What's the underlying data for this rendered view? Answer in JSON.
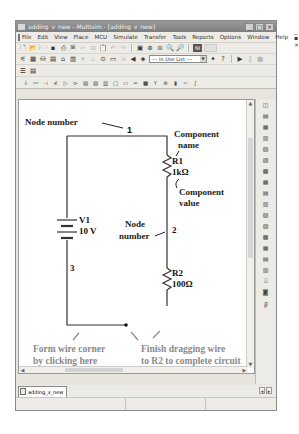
{
  "window": {
    "title": "adding_v_new - Multisim - [adding_v_new]",
    "controls": [
      "minimize",
      "maximize",
      "close"
    ]
  },
  "menubar": {
    "items": [
      "File",
      "Edit",
      "View",
      "Place",
      "MCU",
      "Simulate",
      "Transfer",
      "Tools",
      "Reports",
      "Options",
      "Window",
      "Help"
    ],
    "mdi_controls": "_ ▪ ×"
  },
  "toolbar": {
    "in_use_list": "--- In Use List ---"
  },
  "circuit": {
    "node1": "1",
    "node2": "2",
    "node3": "3",
    "source_name": "V1",
    "source_value": "10 V",
    "r1_name": "R1",
    "r1_value": "1kΩ",
    "r2_name": "R2",
    "r2_value": "100Ω"
  },
  "annotations": {
    "node_number_top": "Node number",
    "component_name_line1": "Component",
    "component_name_line2": "name",
    "component_value_line1": "Component",
    "component_value_line2": "value",
    "node_number_mid_line1": "Node",
    "node_number_mid_line2": "number",
    "wire_corner_line1": "Form wire corner",
    "wire_corner_line2": "by clicking here",
    "wire_corner_line3": "as you drag wire",
    "finish_line1": "Finish dragging wire",
    "finish_line2": "to R2 to complete circuit"
  },
  "tabs": {
    "active": "adding_v_new"
  },
  "colors": {
    "annotation_gray": "#8a8a8a",
    "titlebar": "#8c8c8c",
    "chrome": "#e6e4dc"
  }
}
